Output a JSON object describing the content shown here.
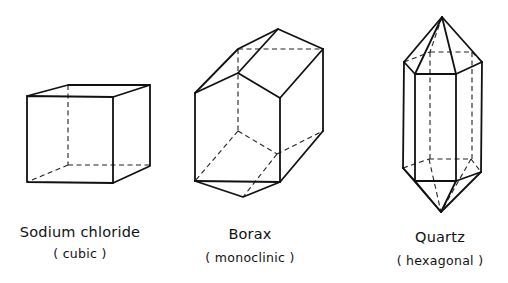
{
  "figure": {
    "crystals": [
      {
        "name": "Sodium chloride",
        "system": "( cubic )"
      },
      {
        "name": "Borax",
        "system": "( monoclinic )"
      },
      {
        "name": "Quartz",
        "system": "( hexagonal )"
      }
    ]
  }
}
